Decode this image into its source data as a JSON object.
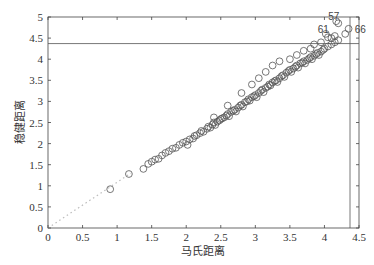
{
  "chart_data": {
    "type": "scatter",
    "title": "",
    "xlabel": "马氏距离",
    "ylabel": "稳健距离",
    "xlim": [
      0,
      4.5
    ],
    "ylim": [
      0,
      5
    ],
    "xticks": [
      "0",
      "0.5",
      "1",
      "1.5",
      "2",
      "2.5",
      "3",
      "3.5",
      "4",
      "4.5"
    ],
    "yticks": [
      "0",
      "0.5",
      "1",
      "1.5",
      "2",
      "2.5",
      "3",
      "3.5",
      "4",
      "4.5",
      "5"
    ],
    "grid": false,
    "legend": null,
    "reference_lines": {
      "diagonal_dotted": {
        "from": [
          0,
          0
        ],
        "to": [
          1.2,
          1.3
        ]
      },
      "horizontal_cutoff": 4.37,
      "vertical_cutoff": 4.37
    },
    "labeled_points": [
      {
        "label": "57",
        "x": 4.17,
        "y": 4.9
      },
      {
        "label": "61",
        "x": 4.02,
        "y": 4.6
      },
      {
        "label": "66",
        "x": 4.35,
        "y": 4.72
      }
    ],
    "series": [
      {
        "name": "observations",
        "marker": "open-circle",
        "points": [
          [
            0.9,
            0.92
          ],
          [
            1.17,
            1.28
          ],
          [
            1.38,
            1.4
          ],
          [
            1.45,
            1.52
          ],
          [
            1.5,
            1.57
          ],
          [
            1.55,
            1.62
          ],
          [
            1.6,
            1.64
          ],
          [
            1.65,
            1.72
          ],
          [
            1.7,
            1.78
          ],
          [
            1.75,
            1.82
          ],
          [
            1.8,
            1.88
          ],
          [
            1.85,
            1.9
          ],
          [
            1.9,
            1.97
          ],
          [
            1.95,
            2.02
          ],
          [
            2.0,
            2.05
          ],
          [
            2.02,
            1.97
          ],
          [
            2.05,
            2.1
          ],
          [
            2.1,
            2.12
          ],
          [
            2.12,
            2.18
          ],
          [
            2.15,
            2.2
          ],
          [
            2.2,
            2.25
          ],
          [
            2.22,
            2.3
          ],
          [
            2.25,
            2.28
          ],
          [
            2.3,
            2.35
          ],
          [
            2.32,
            2.4
          ],
          [
            2.35,
            2.38
          ],
          [
            2.38,
            2.45
          ],
          [
            2.4,
            2.5
          ],
          [
            2.42,
            2.44
          ],
          [
            2.45,
            2.52
          ],
          [
            2.48,
            2.55
          ],
          [
            2.5,
            2.58
          ],
          [
            2.52,
            2.6
          ],
          [
            2.55,
            2.62
          ],
          [
            2.58,
            2.66
          ],
          [
            2.6,
            2.7
          ],
          [
            2.62,
            2.65
          ],
          [
            2.65,
            2.75
          ],
          [
            2.68,
            2.78
          ],
          [
            2.7,
            2.8
          ],
          [
            2.72,
            2.76
          ],
          [
            2.75,
            2.85
          ],
          [
            2.78,
            2.9
          ],
          [
            2.8,
            2.92
          ],
          [
            2.82,
            2.88
          ],
          [
            2.85,
            2.98
          ],
          [
            2.88,
            3.0
          ],
          [
            2.9,
            3.05
          ],
          [
            2.92,
            3.02
          ],
          [
            2.95,
            3.1
          ],
          [
            2.98,
            3.12
          ],
          [
            3.0,
            3.15
          ],
          [
            3.02,
            3.1
          ],
          [
            3.05,
            3.2
          ],
          [
            3.08,
            3.25
          ],
          [
            3.1,
            3.28
          ],
          [
            3.12,
            3.22
          ],
          [
            3.15,
            3.32
          ],
          [
            3.18,
            3.35
          ],
          [
            3.2,
            3.4
          ],
          [
            3.22,
            3.38
          ],
          [
            3.25,
            3.45
          ],
          [
            3.28,
            3.48
          ],
          [
            3.3,
            3.5
          ],
          [
            3.32,
            3.46
          ],
          [
            3.35,
            3.55
          ],
          [
            3.38,
            3.6
          ],
          [
            3.4,
            3.62
          ],
          [
            3.42,
            3.58
          ],
          [
            3.45,
            3.68
          ],
          [
            3.48,
            3.72
          ],
          [
            3.5,
            3.75
          ],
          [
            3.52,
            3.7
          ],
          [
            3.55,
            3.78
          ],
          [
            3.58,
            3.82
          ],
          [
            3.6,
            3.85
          ],
          [
            3.62,
            3.8
          ],
          [
            3.65,
            3.9
          ],
          [
            3.68,
            3.92
          ],
          [
            3.7,
            3.95
          ],
          [
            3.72,
            3.9
          ],
          [
            3.75,
            3.98
          ],
          [
            3.78,
            4.02
          ],
          [
            3.8,
            4.05
          ],
          [
            3.82,
            4.0
          ],
          [
            3.85,
            4.08
          ],
          [
            3.88,
            4.12
          ],
          [
            3.9,
            4.15
          ],
          [
            3.92,
            4.1
          ],
          [
            3.95,
            4.18
          ],
          [
            3.98,
            4.22
          ],
          [
            4.0,
            4.25
          ],
          [
            4.05,
            4.3
          ],
          [
            4.1,
            4.35
          ],
          [
            4.15,
            4.4
          ],
          [
            4.2,
            4.45
          ],
          [
            2.4,
            2.62
          ],
          [
            2.6,
            2.9
          ],
          [
            2.8,
            3.2
          ],
          [
            2.95,
            3.4
          ],
          [
            3.05,
            3.55
          ],
          [
            3.15,
            3.7
          ],
          [
            3.25,
            3.85
          ],
          [
            3.35,
            3.95
          ],
          [
            3.5,
            4.0
          ],
          [
            3.6,
            4.1
          ],
          [
            3.7,
            4.2
          ],
          [
            3.8,
            4.25
          ],
          [
            3.85,
            4.35
          ],
          [
            3.95,
            4.4
          ],
          [
            4.02,
            4.6
          ],
          [
            4.05,
            4.52
          ],
          [
            4.1,
            4.5
          ],
          [
            4.15,
            4.55
          ],
          [
            4.17,
            4.9
          ],
          [
            4.2,
            4.85
          ],
          [
            4.35,
            4.72
          ],
          [
            4.3,
            4.6
          ]
        ]
      }
    ]
  }
}
